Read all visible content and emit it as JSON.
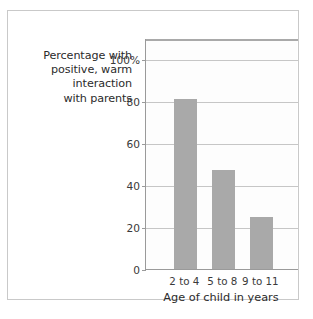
{
  "chart_data": {
    "type": "bar",
    "title": "",
    "subtitle": "",
    "categories": [
      "2 to 4",
      "5 to 8",
      "9 to 11"
    ],
    "values": [
      81,
      47,
      25
    ],
    "xlabel": "Age of child in years",
    "ylabel": "Percentage with positive, warm interaction with parents",
    "ylabel_lines": [
      "Percentage with",
      "positive, warm",
      "interaction",
      "with parents"
    ],
    "ytick_labels": [
      "0",
      "20",
      "40",
      "60",
      "80",
      "100%"
    ],
    "ytick_values": [
      0,
      20,
      40,
      60,
      80,
      100
    ],
    "ylim": [
      0,
      110
    ],
    "grid": true,
    "legend": "none",
    "bar_color": "#a9a9a9",
    "grid_color": "#c6c6c6",
    "axis_color": "#9a9a9a",
    "text_color": "#2b2b2b",
    "frame_color": "#c9c9c9",
    "plot_background": "#fdfdfd"
  }
}
